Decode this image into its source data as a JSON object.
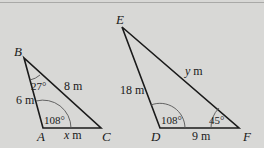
{
  "colors": {
    "background": "#d8d8d6",
    "stroke": "#1a1a1a",
    "arc": "#555555"
  },
  "triangles": [
    {
      "name": "ABC",
      "vertices": {
        "A": "A",
        "B": "B",
        "C": "C"
      },
      "sides": {
        "AB": "6 m",
        "BC": "8 m",
        "AC": "x m"
      },
      "angles": {
        "B": "27°",
        "A": "108°"
      }
    },
    {
      "name": "DEF",
      "vertices": {
        "D": "D",
        "E": "E",
        "F": "F"
      },
      "sides": {
        "DE": "18 m",
        "EF": "y m",
        "DF": "9 m"
      },
      "angles": {
        "D": "108°",
        "F": "45°"
      }
    }
  ]
}
